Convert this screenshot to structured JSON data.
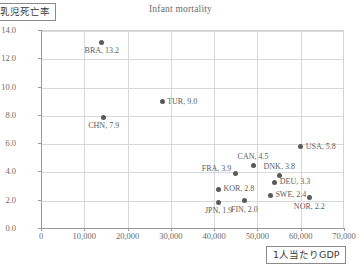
{
  "chart_data": {
    "type": "scatter",
    "title": "Infant mortality",
    "xlabel": "1人当たりGDP",
    "ylabel": "乳児死亡率",
    "xlim": [
      0,
      70000
    ],
    "ylim": [
      0,
      14.0
    ],
    "grid": true,
    "legend": "none",
    "xticks": [
      "0",
      "10,000",
      "20,000",
      "30,000",
      "40,000",
      "50,000",
      "60,000",
      "70,000"
    ],
    "xtick_values": [
      0,
      10000,
      20000,
      30000,
      40000,
      50000,
      60000,
      70000
    ],
    "yticks": [
      "0.0",
      "2.0",
      "4.0",
      "6.0",
      "8.0",
      "10.0",
      "12.0",
      "14.0"
    ],
    "ytick_values": [
      0,
      2,
      4,
      6,
      8,
      10,
      12,
      14
    ],
    "marker_color": "#5a5a5a",
    "points": [
      {
        "label": "BRA, 13.2",
        "code": "BRA",
        "x": 14000,
        "y": 13.2,
        "label_pos": "below"
      },
      {
        "label": "CHN, 7.9",
        "code": "CHN",
        "x": 14500,
        "y": 7.9,
        "label_pos": "below"
      },
      {
        "label": "TUR, 9.0",
        "code": "TUR",
        "x": 28000,
        "y": 9.0,
        "label_pos": "right"
      },
      {
        "label": "FRA, 3.9",
        "code": "FRA",
        "x": 45000,
        "y": 3.9,
        "label_pos": "above-left"
      },
      {
        "label": "CAN, 4.5",
        "code": "CAN",
        "x": 49000,
        "y": 4.5,
        "label_pos": "above"
      },
      {
        "label": "KOR, 2.8",
        "code": "KOR",
        "x": 41000,
        "y": 2.8,
        "label_pos": "right"
      },
      {
        "label": "JPN, 1.9",
        "code": "JPN",
        "x": 41000,
        "y": 1.9,
        "label_pos": "below"
      },
      {
        "label": "FIN, 2.0",
        "code": "FIN",
        "x": 47000,
        "y": 2.0,
        "label_pos": "below"
      },
      {
        "label": "SWE, 2.4",
        "code": "SWE",
        "x": 53000,
        "y": 2.4,
        "label_pos": "right"
      },
      {
        "label": "DEU, 3.3",
        "code": "DEU",
        "x": 54000,
        "y": 3.3,
        "label_pos": "right"
      },
      {
        "label": "DNK, 3.8",
        "code": "DNK",
        "x": 55000,
        "y": 3.8,
        "label_pos": "above"
      },
      {
        "label": "USA, 5.8",
        "code": "USA",
        "x": 60000,
        "y": 5.8,
        "label_pos": "right"
      },
      {
        "label": "NOR, 2.2",
        "code": "NOR",
        "x": 62000,
        "y": 2.2,
        "label_pos": "below"
      }
    ]
  }
}
